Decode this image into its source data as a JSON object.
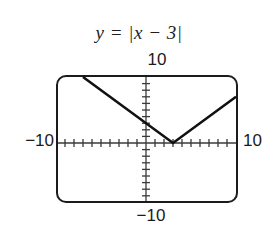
{
  "figure": {
    "title": "y = |x − 3|",
    "background_color": "#ffffff",
    "stroke_color": "#1b1b1b"
  },
  "labels": {
    "top": "10",
    "bottom": "−10",
    "left": "−10",
    "right": "10"
  },
  "chart_data": {
    "type": "line",
    "title": "y = |x − 3|",
    "xlabel": "",
    "ylabel": "",
    "xlim": [
      -10,
      10
    ],
    "ylim": [
      -10,
      10
    ],
    "grid": false,
    "legend": null,
    "x_tick_labels": [
      "−10",
      "10"
    ],
    "y_tick_labels": [
      "−10",
      "10"
    ],
    "x_tick_interval": 1,
    "y_tick_interval": 1,
    "function": "y = |x - 3|",
    "vertex": [
      3,
      0
    ],
    "series": [
      {
        "name": "y = |x - 3|",
        "x": [
          -7,
          3,
          10
        ],
        "y": [
          10,
          0,
          7
        ],
        "color": "#111111",
        "linewidth": 2.6
      }
    ],
    "annotations": [
      {
        "text": "10",
        "position": "top-of-y-axis"
      },
      {
        "text": "−10",
        "position": "bottom-of-y-axis"
      },
      {
        "text": "−10",
        "position": "left-of-x-axis"
      },
      {
        "text": "10",
        "position": "right-of-x-axis"
      }
    ]
  }
}
